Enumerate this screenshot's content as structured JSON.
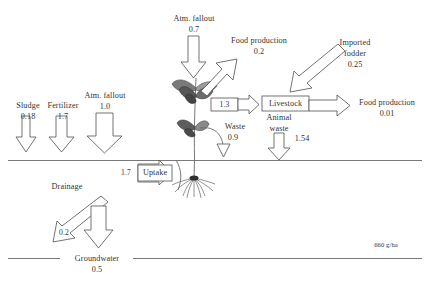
{
  "diagram": {
    "title_unit": "660 g/ha",
    "surface_label": "",
    "groundwater": {
      "label": "Groundwater",
      "value": "0.5"
    },
    "inputs": [
      {
        "name": "sludge",
        "label": "Sludge",
        "value": "0.18"
      },
      {
        "name": "fertilizer",
        "label": "Fertilizer",
        "value": "1.7"
      },
      {
        "name": "atm-fallout-soil",
        "label": "Atm. fallout",
        "value": "1.0"
      }
    ],
    "atm_fallout_plant": {
      "label": "Atm. fallout",
      "value": "0.7"
    },
    "uptake": {
      "label": "Uptake",
      "value": "1.7"
    },
    "food_production_plant": {
      "label": "Food production",
      "value": "0.2"
    },
    "plant_to_livestock": {
      "value": "1.3"
    },
    "livestock": {
      "label": "Livestock"
    },
    "imported_fodder": {
      "label_line1": "Imported",
      "label_line2": "fodder",
      "value": "0.25"
    },
    "food_production_livestock": {
      "label": "Food production",
      "value": "0.01"
    },
    "waste": {
      "label": "Waste",
      "value": "0.9"
    },
    "animal_waste": {
      "label_line1": "Animal",
      "label_line2": "waste",
      "value": "1.54"
    },
    "drainage": {
      "label": "Drainage",
      "value": "0.2"
    }
  }
}
